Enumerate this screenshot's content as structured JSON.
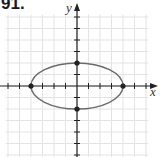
{
  "problem": {
    "number": "91."
  },
  "chart_data": {
    "type": "scatter",
    "title": "",
    "xlabel": "x",
    "ylabel": "y",
    "xlim": [
      -6,
      7
    ],
    "ylim": [
      -6,
      7
    ],
    "grid": true,
    "legend": null,
    "curve": {
      "kind": "ellipse",
      "equation": "x^2/16 + y^2/4 = 1",
      "center": [
        0,
        0
      ],
      "semi_major_x": 4,
      "semi_minor_y": 2,
      "color": "#6b6b6b"
    },
    "points": [
      {
        "x": -4,
        "y": 0
      },
      {
        "x": 4,
        "y": 0
      },
      {
        "x": 0,
        "y": 2
      },
      {
        "x": 0,
        "y": -2
      }
    ],
    "x_ticks": [
      -6,
      -5,
      -4,
      -3,
      -2,
      -1,
      1,
      2,
      3,
      4,
      5,
      6
    ],
    "y_ticks": [
      -6,
      -5,
      -4,
      -3,
      -2,
      -1,
      1,
      2,
      3,
      4,
      5,
      6
    ],
    "colors": {
      "axis": "#222222",
      "grid": "#e3e3e3",
      "curve": "#6b6b6b",
      "point": "#222222"
    }
  },
  "layout": {
    "origin_px": [
      77,
      86
    ],
    "unit_px": 11.5
  }
}
